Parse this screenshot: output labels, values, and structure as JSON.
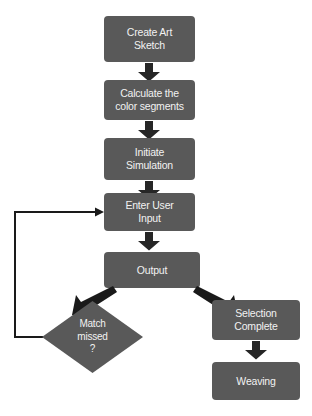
{
  "diagram": {
    "type": "flowchart",
    "colors": {
      "node_fill": "#595959",
      "node_text": "#f2f2f2",
      "arrow": "#262626",
      "background": "#ffffff",
      "loop_line": "#1a1a1a"
    },
    "nodes": [
      {
        "id": "create-art-sketch",
        "shape": "rounded-rect",
        "label": "Create Art\nSketch"
      },
      {
        "id": "calculate-color-segments",
        "shape": "rounded-rect",
        "label": "Calculate the\ncolor segments"
      },
      {
        "id": "initiate-simulation",
        "shape": "rounded-rect",
        "label": "Initiate\nSimulation"
      },
      {
        "id": "enter-user-input",
        "shape": "rounded-rect",
        "label": "Enter User\nInput"
      },
      {
        "id": "output",
        "shape": "rounded-rect",
        "label": "Output"
      },
      {
        "id": "match-missed",
        "shape": "diamond",
        "label": "Match\nmissed\n?"
      },
      {
        "id": "selection-complete",
        "shape": "rounded-rect",
        "label": "Selection\nComplete"
      },
      {
        "id": "weaving",
        "shape": "rounded-rect",
        "label": "Weaving"
      }
    ],
    "edges": [
      {
        "id": "e1",
        "from": "create-art-sketch",
        "to": "calculate-color-segments",
        "style": "block-arrow-down",
        "label": ""
      },
      {
        "id": "e2",
        "from": "calculate-color-segments",
        "to": "initiate-simulation",
        "style": "block-arrow-down",
        "label": ""
      },
      {
        "id": "e3",
        "from": "initiate-simulation",
        "to": "enter-user-input",
        "style": "block-arrow-down",
        "label": ""
      },
      {
        "id": "e4",
        "from": "enter-user-input",
        "to": "output",
        "style": "block-arrow-down",
        "label": ""
      },
      {
        "id": "e5",
        "from": "output",
        "to": "match-missed",
        "style": "block-arrow-diagonal-left",
        "label": ""
      },
      {
        "id": "e6",
        "from": "output",
        "to": "selection-complete",
        "style": "block-arrow-diagonal-right",
        "label": ""
      },
      {
        "id": "e7",
        "from": "match-missed",
        "to": "enter-user-input",
        "style": "thin-line-feedback-loop",
        "label": ""
      },
      {
        "id": "e8",
        "from": "selection-complete",
        "to": "weaving",
        "style": "block-arrow-down",
        "label": ""
      }
    ]
  }
}
